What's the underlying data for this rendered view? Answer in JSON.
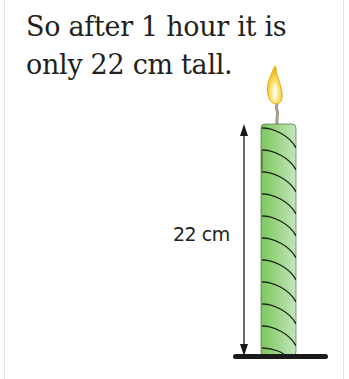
{
  "caption": {
    "line1": "So after 1 hour it is",
    "line2": "only 22 cm tall."
  },
  "diagram": {
    "measurement_label": "22 cm",
    "height_value": 22,
    "height_unit": "cm",
    "elapsed_time": "1 hour",
    "object": "twisted candle",
    "colors": {
      "candle_light": "#b9e0b0",
      "candle_mid": "#8ccf6e",
      "candle_dark": "#6cbf55",
      "flame_outer": "#f3c626",
      "flame_inner": "#fff3a8",
      "wick": "#a89a8a",
      "ink": "#1a1a1a"
    }
  }
}
